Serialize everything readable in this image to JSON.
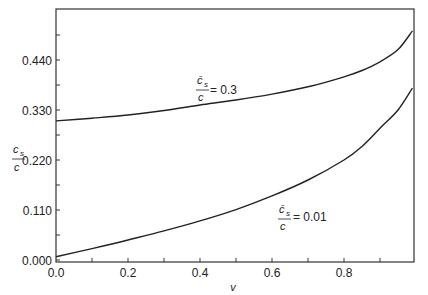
{
  "chart_data": {
    "type": "line",
    "title": "",
    "xlabel": "v",
    "ylabel": "c_s / c",
    "xlim": [
      0.0,
      0.994
    ],
    "ylim": [
      -0.004,
      0.553
    ],
    "grid": false,
    "legend": "none (inline curve annotations)",
    "x_ticks": [
      "0.0",
      "0.2",
      "0.4",
      "0.6",
      "0.8"
    ],
    "y_ticks": [
      "0.000",
      "0.110",
      "0.220",
      "0.330",
      "0.440"
    ],
    "series": [
      {
        "name": "c̄s/c = 0.3",
        "label_lhs_num": "c̄",
        "label_lhs_sub": "s",
        "label_lhs_den": "c",
        "label_rhs": "= 0.3",
        "x": [
          0.0,
          0.1,
          0.2,
          0.3,
          0.4,
          0.5,
          0.6,
          0.7,
          0.8,
          0.85,
          0.9,
          0.95,
          0.99
        ],
        "y": [
          0.306,
          0.312,
          0.319,
          0.329,
          0.341,
          0.352,
          0.365,
          0.381,
          0.403,
          0.417,
          0.436,
          0.463,
          0.504
        ]
      },
      {
        "name": "c̄s/c = 0.01",
        "label_lhs_num": "c̄",
        "label_lhs_sub": "s",
        "label_lhs_den": "c",
        "label_rhs": "= 0.01",
        "x": [
          0.0,
          0.1,
          0.2,
          0.3,
          0.4,
          0.5,
          0.6,
          0.7,
          0.8,
          0.85,
          0.9,
          0.95,
          0.99
        ],
        "y": [
          0.007,
          0.025,
          0.044,
          0.064,
          0.086,
          0.111,
          0.141,
          0.176,
          0.22,
          0.25,
          0.29,
          0.33,
          0.378
        ]
      }
    ]
  },
  "axes": {
    "x_label": "v",
    "y_label_num": "c",
    "y_label_sub": "s",
    "y_label_den": "c"
  },
  "annotations": {
    "upper": {
      "num": "c̄",
      "sub": "s",
      "den": "c",
      "rhs": "= 0.3"
    },
    "lower": {
      "num": "c̄",
      "sub": "s",
      "den": "c",
      "rhs": "= 0.01"
    }
  }
}
